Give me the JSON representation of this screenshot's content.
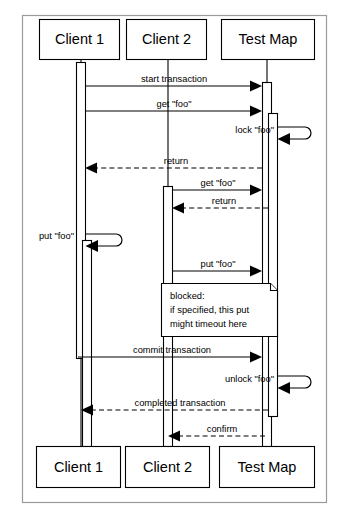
{
  "diagram": {
    "type": "uml-sequence-diagram",
    "title": "",
    "frame": {
      "x": 22,
      "y": 15,
      "width": 305,
      "height": 488,
      "stroke": "#9a9a9a"
    },
    "participants": [
      {
        "id": "client1",
        "label": "Client 1",
        "lifeline_x": 81
      },
      {
        "id": "client2",
        "label": "Client 2",
        "lifeline_x": 168
      },
      {
        "id": "testmap",
        "label": "Test Map",
        "lifeline_x": 267
      }
    ],
    "header_boxes": [
      {
        "label": "Client 1",
        "x": 39,
        "y": 19,
        "width": 80,
        "height": 40
      },
      {
        "label": "Client 2",
        "x": 126,
        "y": 19,
        "width": 80,
        "height": 40
      },
      {
        "label": "Test Map",
        "x": 221,
        "y": 19,
        "width": 94,
        "height": 40
      }
    ],
    "footer_boxes": [
      {
        "label": "Client 1",
        "x": 36,
        "y": 446,
        "width": 84,
        "height": 41
      },
      {
        "label": "Client 2",
        "x": 125,
        "y": 446,
        "width": 84,
        "height": 41
      },
      {
        "label": "Test Map",
        "x": 219,
        "y": 446,
        "width": 96,
        "height": 41
      }
    ],
    "messages": [
      {
        "id": "m1",
        "label": "start transaction",
        "from": "client1",
        "to": "testmap",
        "y": 86,
        "style": "solid",
        "direction": "right"
      },
      {
        "id": "m2",
        "label": "get \"foo\"",
        "from": "client1",
        "to": "testmap",
        "y": 111,
        "style": "solid",
        "direction": "right"
      },
      {
        "id": "m3",
        "label": "lock \"foo\"",
        "from": "testmap",
        "to": "testmap",
        "y": 133,
        "style": "self",
        "direction": "self"
      },
      {
        "id": "m4",
        "label": "return",
        "from": "testmap",
        "to": "client1",
        "y": 168,
        "style": "dashed",
        "direction": "left"
      },
      {
        "id": "m5",
        "label": "get \"foo\"",
        "from": "client2",
        "to": "testmap",
        "y": 190,
        "style": "solid",
        "direction": "right"
      },
      {
        "id": "m6",
        "label": "return",
        "from": "testmap",
        "to": "client2",
        "y": 208,
        "style": "dashed",
        "direction": "left"
      },
      {
        "id": "m7",
        "label": "put \"foo\"",
        "from": "client1",
        "to": "client1",
        "y": 240,
        "style": "self",
        "direction": "self"
      },
      {
        "id": "m8",
        "label": "put \"foo\"",
        "from": "client2",
        "to": "testmap",
        "y": 271,
        "style": "solid",
        "direction": "right"
      },
      {
        "id": "m9",
        "label": "commit transaction",
        "from": "client1",
        "to": "testmap",
        "y": 357,
        "style": "solid",
        "direction": "right"
      },
      {
        "id": "m10",
        "label": "unlock \"foo\"",
        "from": "testmap",
        "to": "testmap",
        "y": 382,
        "style": "self",
        "direction": "self"
      },
      {
        "id": "m11",
        "label": "completed transaction",
        "from": "testmap",
        "to": "client1",
        "y": 410,
        "style": "dashed",
        "direction": "left"
      },
      {
        "id": "m12",
        "label": "confirm",
        "from": "testmap",
        "to": "client2",
        "y": 436,
        "style": "dashed",
        "direction": "left"
      }
    ],
    "note": {
      "id": "note-blocked",
      "lines": [
        "blocked:",
        "if specified, this put",
        "might timeout here"
      ],
      "x": 161,
      "y": 283,
      "width": 116,
      "height": 53
    },
    "activations": [
      {
        "owner": "client1",
        "x": 77,
        "y": 62,
        "width": 8,
        "height": 296
      },
      {
        "owner": "client1",
        "x": 81,
        "y": 240,
        "width": 8,
        "height": 178
      },
      {
        "owner": "client2",
        "x": 164,
        "y": 186,
        "width": 8,
        "height": 260
      },
      {
        "owner": "testmap",
        "x": 263,
        "y": 62,
        "width": 8,
        "height": 384
      },
      {
        "owner": "testmap",
        "x": 269,
        "y": 115,
        "width": 8,
        "height": 300
      }
    ],
    "colors": {
      "background": "#ffffff",
      "line": "#000000",
      "frame": "#9a9a9a",
      "box_fill": "#ffffff"
    }
  }
}
